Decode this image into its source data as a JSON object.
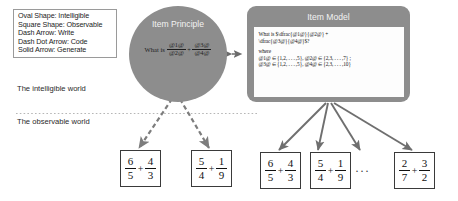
{
  "legend": {
    "name": "shape-and-arrow-legend",
    "rows": [
      "Oval Shape: Intelligible",
      "Square Shape: Observable",
      "Dash Arrow: Write",
      "Dash Dot Arrow: Code",
      "Solid Arrow: Generate"
    ]
  },
  "worlds": {
    "intelligible": "The intelligible world",
    "observable": "The observable world"
  },
  "item_principle": {
    "title": "Item Principle",
    "lead": "What is",
    "expression": {
      "left": {
        "numerator": "@1@",
        "denominator": "@2@"
      },
      "operator": "+",
      "right": {
        "numerator": "@3@",
        "denominator": "@4@"
      }
    }
  },
  "item_model": {
    "title": "Item Model",
    "code_lines": [
      "What is $\\dfrac{@1@}{@2@} +",
      "\\dfrac{@3@}{@4@}$?"
    ],
    "where_label": "where",
    "where_lines": [
      "@1@ ∈ {1,2, . . . ,5}, @2@ ∈ {2,3, . . . ,7} ;",
      "@3@ ∈ {1,2, . . . ,5}, @4@ ∈ {2,3, . . . ,10}"
    ]
  },
  "outputs": {
    "intelligible_boxes": [
      {
        "left": {
          "numerator": "6",
          "denominator": "5"
        },
        "operator": "+",
        "right": {
          "numerator": "4",
          "denominator": "3"
        }
      },
      {
        "left": {
          "numerator": "5",
          "denominator": "4"
        },
        "operator": "+",
        "right": {
          "numerator": "1",
          "denominator": "9"
        }
      }
    ],
    "observable_boxes": [
      {
        "left": {
          "numerator": "6",
          "denominator": "5"
        },
        "operator": "+",
        "right": {
          "numerator": "4",
          "denominator": "3"
        }
      },
      {
        "left": {
          "numerator": "5",
          "denominator": "4"
        },
        "operator": "+",
        "right": {
          "numerator": "1",
          "denominator": "9"
        }
      },
      {
        "left": {
          "numerator": "2",
          "denominator": "7"
        },
        "operator": "+",
        "right": {
          "numerator": "3",
          "denominator": "2"
        }
      }
    ],
    "ellipsis": "···"
  },
  "colors": {
    "shape_fill": "#8d8d8d",
    "shape_title": "#f2f2f2",
    "arrow": "#6f6f6f",
    "panel": "#fdfdfd",
    "divider": "#b6b6b6",
    "box_border": "#3a3a3a"
  }
}
